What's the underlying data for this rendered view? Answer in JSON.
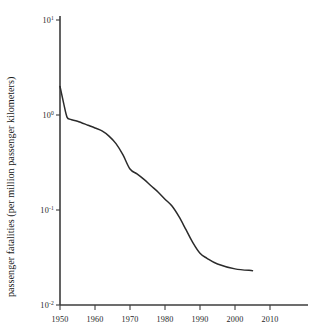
{
  "chart_data": {
    "type": "line",
    "title": "",
    "xlabel": "",
    "ylabel": "passenger fatalities (per million passenger kilometers)",
    "yscale": "log",
    "xlim": [
      1950,
      2010
    ],
    "ylim": [
      0.01,
      10
    ],
    "grid": false,
    "legend": null,
    "x_ticks": [
      "1950",
      "1960",
      "1970",
      "1980",
      "1990",
      "2000",
      "2010"
    ],
    "x_tick_values": [
      1950,
      1960,
      1970,
      1980,
      1990,
      2000,
      2010
    ],
    "y_ticks": [
      {
        "mantissa": "10",
        "exponent": "1",
        "value": 10
      },
      {
        "mantissa": "10",
        "exponent": "0",
        "value": 1
      },
      {
        "mantissa": "10",
        "exponent": "-1",
        "value": 0.1
      },
      {
        "mantissa": "10",
        "exponent": "-2",
        "value": 0.01
      }
    ],
    "series": [
      {
        "name": "passenger fatalities",
        "x": [
          1950,
          1951,
          1952,
          1953,
          1955,
          1958,
          1960,
          1962,
          1964,
          1966,
          1968,
          1970,
          1972,
          1974,
          1976,
          1978,
          1980,
          1982,
          1984,
          1986,
          1988,
          1990,
          1992,
          1995,
          2000,
          2005
        ],
        "y": [
          2.0,
          1.35,
          0.95,
          0.9,
          0.86,
          0.78,
          0.73,
          0.68,
          0.6,
          0.5,
          0.38,
          0.27,
          0.24,
          0.21,
          0.18,
          0.155,
          0.13,
          0.11,
          0.085,
          0.062,
          0.045,
          0.035,
          0.031,
          0.027,
          0.024,
          0.023
        ]
      }
    ]
  },
  "axes": {
    "y_title": "passenger fatalities (per million passenger kilometers)"
  }
}
